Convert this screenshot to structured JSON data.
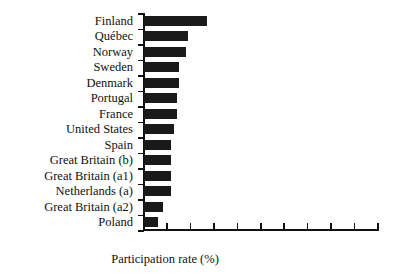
{
  "chart_data": {
    "type": "bar",
    "orientation": "horizontal",
    "title": "",
    "xlabel": "Participation rate (%)",
    "ylabel": "",
    "categories": [
      "Finland",
      "Québec",
      "Norway",
      "Sweden",
      "Denmark",
      "Portugal",
      "France",
      "United States",
      "Spain",
      "Great Britain (b)",
      "Great Britain (a1)",
      "Netherlands (a)",
      "Great Britain (a2)",
      "Poland"
    ],
    "values": [
      27,
      19,
      18,
      15,
      15,
      14,
      14,
      13,
      11.5,
      11.5,
      11.5,
      11.5,
      8,
      6
    ],
    "xlim": [
      0,
      100
    ],
    "x_tick_count": 11,
    "x_tick_labels": [
      "",
      "",
      "",
      "",
      "",
      "",
      "",
      "",
      "",
      "",
      ""
    ],
    "grid": false,
    "legend": false,
    "bar_color": "#1a1a1a",
    "axis_color": "#111111",
    "background_color": "#ffffff"
  },
  "axis": {
    "x_title": "Participation rate (%)"
  }
}
